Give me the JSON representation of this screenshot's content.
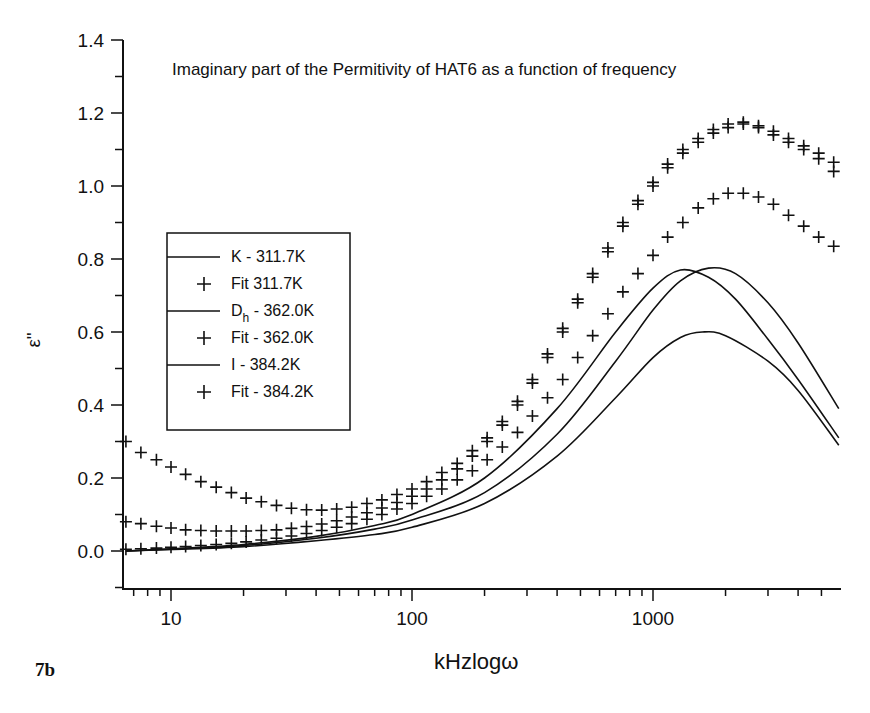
{
  "figure_label": "7b",
  "chart_data": {
    "type": "line",
    "title": "Imaginary part of the Permitivity of HAT6 as a function of frequency",
    "xlabel": "kHzlogω",
    "ylabel": "ε\"",
    "xscale": "log",
    "xlim": [
      6.5,
      5900
    ],
    "ylim": [
      -0.1,
      1.4
    ],
    "x_ticks": [
      10,
      100,
      1000
    ],
    "x_tick_labels": [
      "10",
      "100",
      "1000"
    ],
    "y_ticks": [
      0.0,
      0.2,
      0.4,
      0.6,
      0.8,
      1.0,
      1.2,
      1.4
    ],
    "y_tick_labels": [
      "0.0",
      "0.2",
      "0.4",
      "0.6",
      "0.8",
      "1.0",
      "1.2",
      "1.4"
    ],
    "grid": false,
    "legend_position": "left-middle",
    "legend": [
      {
        "label": "K - 311.7K",
        "marker": "line"
      },
      {
        "label": "Fit 311.7K",
        "marker": "+"
      },
      {
        "label_main": "D",
        "label_sub": "h",
        "label_rest": " - 362.0K",
        "label": "Dh - 362.0K",
        "marker": "line"
      },
      {
        "label": "Fit - 362.0K",
        "marker": "+"
      },
      {
        "label": "I - 384.2K",
        "marker": "line"
      },
      {
        "label": "Fit - 384.2K",
        "marker": "+"
      }
    ],
    "series": [
      {
        "name": "K - 311.7K",
        "style": "line",
        "x": [
          6.5,
          10,
          20,
          40,
          70,
          100,
          200,
          400,
          700,
          1000,
          1300,
          1700,
          2200,
          3000,
          4000,
          5900
        ],
        "values": [
          0.0,
          0.005,
          0.015,
          0.035,
          0.06,
          0.085,
          0.16,
          0.32,
          0.52,
          0.66,
          0.74,
          0.775,
          0.76,
          0.68,
          0.57,
          0.39
        ]
      },
      {
        "name": "Dh - 362.0K",
        "style": "line",
        "x": [
          6.5,
          10,
          20,
          40,
          70,
          100,
          200,
          400,
          700,
          1000,
          1300,
          1700,
          2200,
          3000,
          4000,
          5900
        ],
        "values": [
          0.0,
          0.006,
          0.018,
          0.04,
          0.07,
          0.1,
          0.2,
          0.39,
          0.6,
          0.72,
          0.77,
          0.75,
          0.69,
          0.58,
          0.47,
          0.31
        ]
      },
      {
        "name": "I - 384.2K",
        "style": "line",
        "x": [
          6.5,
          10,
          20,
          40,
          70,
          100,
          200,
          400,
          700,
          1000,
          1300,
          1600,
          2000,
          3000,
          4000,
          5900
        ],
        "values": [
          0.0,
          0.004,
          0.012,
          0.028,
          0.045,
          0.065,
          0.13,
          0.26,
          0.42,
          0.53,
          0.585,
          0.6,
          0.59,
          0.52,
          0.44,
          0.29
        ]
      },
      {
        "name": "Fit 311.7K",
        "style": "markers",
        "x": [
          6.5,
          7.5,
          8.7,
          10,
          11.5,
          13.3,
          15.4,
          17.8,
          20.5,
          23.7,
          27.4,
          31.6,
          36.5,
          42.2,
          48.7,
          56.2,
          65,
          75,
          86.6,
          100,
          115,
          133,
          154,
          178,
          205,
          237,
          274,
          316,
          365,
          422,
          487,
          562,
          650,
          750,
          866,
          1000,
          1150,
          1330,
          1540,
          1780,
          2050,
          2370,
          2740,
          3160,
          3650,
          4220,
          4870,
          5620
        ],
        "values": [
          0.3,
          0.27,
          0.25,
          0.23,
          0.21,
          0.19,
          0.175,
          0.16,
          0.145,
          0.135,
          0.125,
          0.117,
          0.113,
          0.112,
          0.115,
          0.12,
          0.13,
          0.14,
          0.155,
          0.17,
          0.19,
          0.215,
          0.24,
          0.275,
          0.31,
          0.355,
          0.41,
          0.47,
          0.54,
          0.61,
          0.69,
          0.76,
          0.83,
          0.9,
          0.96,
          1.01,
          1.06,
          1.1,
          1.13,
          1.155,
          1.17,
          1.175,
          1.165,
          1.15,
          1.13,
          1.11,
          1.09,
          1.065
        ]
      },
      {
        "name": "Fit - 362.0K",
        "style": "markers",
        "x": [
          6.5,
          7.5,
          8.7,
          10,
          11.5,
          13.3,
          15.4,
          17.8,
          20.5,
          23.7,
          27.4,
          31.6,
          36.5,
          42.2,
          48.7,
          56.2,
          65,
          75,
          86.6,
          100,
          115,
          133,
          154,
          178,
          205,
          237,
          274,
          316,
          365,
          422,
          487,
          562,
          650,
          750,
          866,
          1000,
          1150,
          1330,
          1540,
          1780,
          2050,
          2370,
          2740,
          3160,
          3650,
          4220,
          4870,
          5620
        ],
        "values": [
          0.08,
          0.075,
          0.068,
          0.063,
          0.058,
          0.056,
          0.055,
          0.055,
          0.055,
          0.056,
          0.058,
          0.062,
          0.067,
          0.074,
          0.083,
          0.093,
          0.105,
          0.118,
          0.133,
          0.15,
          0.17,
          0.195,
          0.225,
          0.26,
          0.3,
          0.345,
          0.4,
          0.46,
          0.53,
          0.6,
          0.68,
          0.75,
          0.82,
          0.89,
          0.95,
          1.0,
          1.05,
          1.09,
          1.12,
          1.145,
          1.16,
          1.17,
          1.16,
          1.14,
          1.12,
          1.1,
          1.075,
          1.04
        ]
      },
      {
        "name": "Fit - 384.2K",
        "style": "markers",
        "x": [
          6.5,
          7.5,
          8.7,
          10,
          11.5,
          13.3,
          15.4,
          17.8,
          20.5,
          23.7,
          27.4,
          31.6,
          36.5,
          42.2,
          48.7,
          56.2,
          65,
          75,
          86.6,
          100,
          115,
          133,
          154,
          178,
          205,
          237,
          274,
          316,
          365,
          422,
          487,
          562,
          650,
          750,
          866,
          1000,
          1150,
          1330,
          1540,
          1780,
          2050,
          2370,
          2740,
          3160,
          3650,
          4220,
          4870,
          5620
        ],
        "values": [
          0.005,
          0.006,
          0.008,
          0.01,
          0.012,
          0.015,
          0.018,
          0.021,
          0.025,
          0.03,
          0.035,
          0.041,
          0.048,
          0.056,
          0.065,
          0.075,
          0.087,
          0.1,
          0.115,
          0.13,
          0.15,
          0.17,
          0.195,
          0.22,
          0.25,
          0.285,
          0.325,
          0.37,
          0.42,
          0.47,
          0.53,
          0.59,
          0.65,
          0.71,
          0.76,
          0.81,
          0.86,
          0.9,
          0.94,
          0.965,
          0.98,
          0.98,
          0.97,
          0.95,
          0.92,
          0.89,
          0.86,
          0.835
        ]
      }
    ]
  }
}
